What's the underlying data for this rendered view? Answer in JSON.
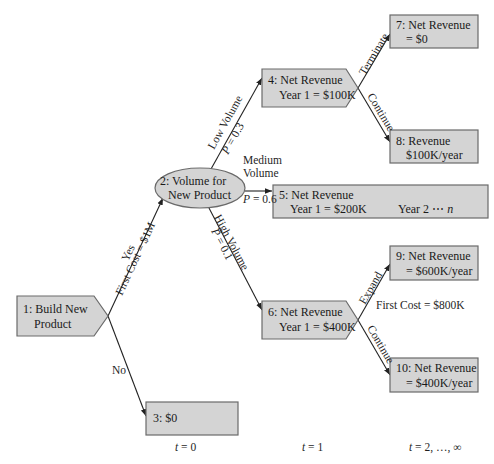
{
  "diagram": {
    "type": "decision-tree",
    "nodes": {
      "n1": {
        "line1": "1: Build New",
        "line2": "Product",
        "shape": "decision-pentagon"
      },
      "n2": {
        "line1": "2: Volume for",
        "line2": "New Product",
        "shape": "chance-ellipse"
      },
      "n3": {
        "line1": "3: $0",
        "shape": "outcome-rect"
      },
      "n4": {
        "line1": "4: Net Revenue",
        "line2": "Year 1 = $100K",
        "shape": "decision-pentagon"
      },
      "n5": {
        "line1": "5: Net Revenue",
        "line2": "Year 1 = $200K",
        "line2b": "Year 2 ⋯",
        "line2c": "n",
        "shape": "outcome-rect"
      },
      "n6": {
        "line1": "6: Net Revenue",
        "line2": "Year 1 = $400K",
        "shape": "decision-pentagon"
      },
      "n7": {
        "line1": "7: Net Revenue",
        "line2": "= $0",
        "shape": "outcome-rect"
      },
      "n8": {
        "line1": "8: Revenue",
        "line2": "$100K/year",
        "shape": "outcome-rect"
      },
      "n9": {
        "line1": "9: Net Revenue",
        "line2": "= $600K/year",
        "shape": "outcome-rect"
      },
      "n10": {
        "line1": "10: Net Revenue",
        "line2": "= $400K/year",
        "shape": "outcome-rect"
      }
    },
    "edges": {
      "yes": {
        "label": "Yes",
        "sublabel": "First Cost = $1M",
        "from": "n1",
        "to": "n2"
      },
      "no": {
        "label": "No",
        "from": "n1",
        "to": "n3"
      },
      "low": {
        "label": "Low Volume",
        "prob_var": "P",
        "prob": "= 0.3",
        "from": "n2",
        "to": "n4"
      },
      "medium": {
        "label1": "Medium",
        "label2": "Volume",
        "prob_var": "P",
        "prob": "= 0.6",
        "from": "n2",
        "to": "n5"
      },
      "high": {
        "label": "High Volume",
        "prob_var": "P",
        "prob": "= 0.1",
        "from": "n2",
        "to": "n6"
      },
      "terminate": {
        "label": "Terminate",
        "from": "n4",
        "to": "n7"
      },
      "continue4": {
        "label": "Continue",
        "from": "n4",
        "to": "n8"
      },
      "expand": {
        "label": "Expand",
        "sublabel": "First Cost = $800K",
        "from": "n6",
        "to": "n9"
      },
      "continue6": {
        "label": "Continue",
        "from": "n6",
        "to": "n10"
      }
    },
    "time_axis": {
      "t0_var": "t",
      "t0": "= 0",
      "t1_var": "t",
      "t1": "= 1",
      "t2_var": "t",
      "t2": "= 2, …, ∞"
    },
    "colors": {
      "node_fill": "#d4d4d4",
      "node_border": "#6a6a6a",
      "line": "#222222",
      "text": "#1a1a1a"
    }
  }
}
